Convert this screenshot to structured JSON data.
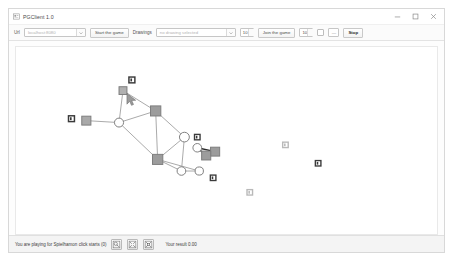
{
  "window": {
    "title": "PGClient 1.0",
    "app_icon": "app-icon",
    "controls": {
      "minimize": "minimize-icon",
      "maximize": "maximize-icon",
      "close": "close-icon"
    }
  },
  "toolbar": {
    "url_label": "Url",
    "server_combo": {
      "value": "",
      "placeholder": "localhost:8080"
    },
    "start_button": "Start the game",
    "drawing_label": "Drawings",
    "drawing_combo": {
      "value": "",
      "placeholder": "no drawing selected"
    },
    "drawing_count": "10",
    "join_button": "Join the game",
    "player_count": "10",
    "checkbox_checked": false,
    "dash_label": "—",
    "stop_button": "Stop"
  },
  "status": {
    "message": "You are playing for Spielhamon click starts (0)",
    "buttons": [
      {
        "name": "zoom-fit-button",
        "icon": "zoom-fit-icon"
      },
      {
        "name": "zoom-out-button",
        "icon": "zoom-out-icon"
      },
      {
        "name": "zoom-in-button",
        "icon": "zoom-in-icon"
      }
    ],
    "result_label": "Your result 0.00"
  },
  "chart_data": {
    "type": "graph",
    "view_box": "0 0 425 193",
    "colors": {
      "node_fill_circle": "#ffffff",
      "node_fill_square": "#9e9e9e",
      "node_stroke": "#7d7d7d",
      "edge_light": "#a8a8a8",
      "edge_dark": "#2b2b2b",
      "marker_dark": "#3a3a3a",
      "marker_light": "#b9b9b9",
      "canvas_bg": "#ffffff"
    },
    "nodes": [
      {
        "id": "n1",
        "shape": "square",
        "x": 108,
        "y": 45,
        "r": 4.0,
        "fill": "#b0b0b0"
      },
      {
        "id": "n2",
        "shape": "circle",
        "x": 104,
        "y": 78,
        "r": 4.6,
        "fill": "#ffffff"
      },
      {
        "id": "n3",
        "shape": "square",
        "x": 71,
        "y": 76,
        "r": 4.6,
        "fill": "#a9a9a9"
      },
      {
        "id": "n4",
        "shape": "square",
        "x": 141,
        "y": 66,
        "r": 5.2,
        "fill": "#9c9c9c"
      },
      {
        "id": "n5",
        "shape": "square",
        "x": 143,
        "y": 116,
        "r": 5.2,
        "fill": "#9c9c9c"
      },
      {
        "id": "n6",
        "shape": "circle",
        "x": 170,
        "y": 93,
        "r": 5.0,
        "fill": "#ffffff"
      },
      {
        "id": "n7",
        "shape": "circle",
        "x": 167,
        "y": 128,
        "r": 4.4,
        "fill": "#ffffff"
      },
      {
        "id": "n8",
        "shape": "circle",
        "x": 183,
        "y": 104,
        "r": 4.4,
        "fill": "#ffffff"
      },
      {
        "id": "n9",
        "shape": "square",
        "x": 201,
        "y": 108,
        "r": 4.6,
        "fill": "#9c9c9c"
      },
      {
        "id": "n10",
        "shape": "circle",
        "x": 185,
        "y": 128,
        "r": 4.2,
        "fill": "#ffffff"
      }
    ],
    "edges": [
      {
        "from": "n1",
        "to": "n2",
        "style": "light"
      },
      {
        "from": "n1",
        "to": "n4",
        "style": "light"
      },
      {
        "from": "n2",
        "to": "n3",
        "style": "light"
      },
      {
        "from": "n2",
        "to": "n4",
        "style": "light"
      },
      {
        "from": "n2",
        "to": "n5",
        "style": "light"
      },
      {
        "from": "n4",
        "to": "n5",
        "style": "light"
      },
      {
        "from": "n4",
        "to": "n6",
        "style": "light"
      },
      {
        "from": "n5",
        "to": "n6",
        "style": "light"
      },
      {
        "from": "n5",
        "to": "n7",
        "style": "light"
      },
      {
        "from": "n5",
        "to": "n10",
        "style": "light"
      },
      {
        "from": "n6",
        "to": "n7",
        "style": "light"
      },
      {
        "from": "n7",
        "to": "n10",
        "style": "light"
      },
      {
        "from": "n8",
        "to": "n9",
        "style": "dark"
      },
      {
        "from": "n8",
        "to": "n11",
        "style": "dark"
      },
      {
        "from": "n9",
        "to": "n11",
        "style": "dark"
      }
    ],
    "markers": [
      {
        "id": "m1",
        "x": 117,
        "y": 34,
        "size": 7.5,
        "tone": "dark"
      },
      {
        "id": "m2",
        "x": 56,
        "y": 74,
        "size": 7.5,
        "tone": "dark"
      },
      {
        "id": "m3",
        "x": 183,
        "y": 93,
        "size": 7.0,
        "tone": "dark"
      },
      {
        "id": "m4",
        "x": 199,
        "y": 135,
        "size": 7.0,
        "tone": "dark"
      },
      {
        "id": "m5",
        "x": 272,
        "y": 101,
        "size": 7.0,
        "tone": "light"
      },
      {
        "id": "m6",
        "x": 236,
        "y": 150,
        "size": 7.0,
        "tone": "light"
      },
      {
        "id": "m7",
        "x": 305,
        "y": 120,
        "size": 7.0,
        "tone": "dark"
      }
    ],
    "hidden_nodes": [
      {
        "id": "n11",
        "shape": "square",
        "x": 192,
        "y": 112,
        "r": 4.6,
        "fill": "#9c9c9c"
      }
    ],
    "cursor": {
      "x": 112,
      "y": 48,
      "label": "mouse-cursor"
    }
  }
}
